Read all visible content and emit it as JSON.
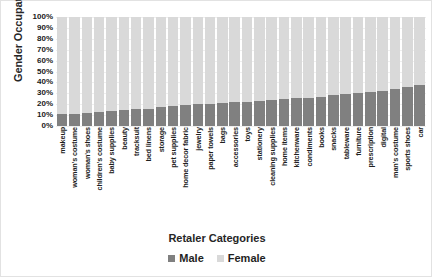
{
  "chart_data": {
    "type": "bar",
    "subtype": "stacked-100-percent",
    "title": "",
    "xlabel": "Retaler Categories",
    "ylabel": "Gender Occupation Ratio",
    "ylim": [
      0,
      100
    ],
    "ytick_labels": [
      "100%",
      "90%",
      "80%",
      "70%",
      "60%",
      "50%",
      "40%",
      "30%",
      "20%",
      "10%",
      "0%"
    ],
    "ytick_values": [
      100,
      90,
      80,
      70,
      60,
      50,
      40,
      30,
      20,
      10,
      0
    ],
    "grid": true,
    "legend_position": "bottom",
    "categories": [
      "makeup",
      "woman's costume",
      "woman's shoes",
      "children's costume",
      "baby supplies",
      "beauty",
      "tracksuit",
      "bed linens",
      "storage",
      "pet supplies",
      "home decor fabric",
      "jewelry",
      "paper towels",
      "bags",
      "accessories",
      "toys",
      "stationery",
      "cleaning supplies",
      "home items",
      "kitchenware",
      "condiments",
      "books",
      "snacks",
      "tableware",
      "furniture",
      "prescription",
      "digital",
      "man's costume",
      "sports shoes",
      "car"
    ],
    "series": [
      {
        "name": "Male",
        "color": "#808080",
        "values": [
          11,
          11,
          12,
          13,
          14,
          15,
          16,
          16,
          17,
          18,
          19,
          20,
          20,
          21,
          22,
          22,
          23,
          24,
          25,
          26,
          26,
          27,
          28,
          29,
          30,
          31,
          32,
          34,
          36,
          38
        ]
      },
      {
        "name": "Female",
        "color": "#d9d9d9",
        "values": [
          89,
          89,
          88,
          87,
          86,
          85,
          84,
          84,
          83,
          82,
          81,
          80,
          80,
          79,
          78,
          78,
          77,
          76,
          75,
          74,
          74,
          73,
          72,
          71,
          70,
          69,
          68,
          66,
          64,
          62
        ]
      }
    ]
  },
  "legend": {
    "items": [
      {
        "label": "Male",
        "color": "#808080"
      },
      {
        "label": "Female",
        "color": "#d9d9d9"
      }
    ]
  }
}
